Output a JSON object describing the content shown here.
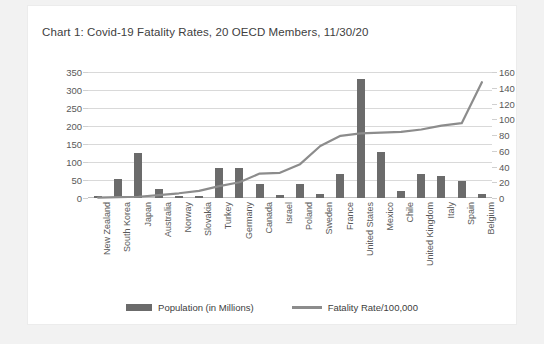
{
  "chart_data": {
    "type": "bar",
    "title": "Chart 1: Covid-19 Fatality Rates, 20 OECD Members, 11/30/20",
    "xlabel": "",
    "ylabel": "",
    "categories": [
      "New Zealand",
      "South Korea",
      "Japan",
      "Australia",
      "Norway",
      "Slovakia",
      "Turkey",
      "Germany",
      "Canada",
      "Israel",
      "Poland",
      "Sweden",
      "France",
      "United States",
      "Mexico",
      "Chile",
      "United Kingdom",
      "Italy",
      "Spain",
      "Belgium"
    ],
    "series": [
      {
        "name": "Population (in Millions)",
        "type": "bar",
        "axis": "left",
        "color": "#6b6b6b",
        "values": [
          5,
          52,
          126,
          25,
          5,
          5,
          84,
          83,
          38,
          9,
          38,
          10,
          67,
          330,
          128,
          19,
          67,
          60,
          47,
          11
        ]
      },
      {
        "name": "Fatality Rate/100,000",
        "type": "line",
        "axis": "right",
        "color": "#8c8c8c",
        "values": [
          0.5,
          1.0,
          1.6,
          3.7,
          6.0,
          9.0,
          15.0,
          20.0,
          31.0,
          32.0,
          43.0,
          66.0,
          79.0,
          82.0,
          83.0,
          84.0,
          87.0,
          92.0,
          95.0,
          147.0
        ]
      }
    ],
    "left_axis": {
      "ticks": [
        0,
        50,
        100,
        150,
        200,
        250,
        300,
        350
      ],
      "ylim": [
        0,
        350
      ]
    },
    "right_axis": {
      "ticks": [
        0,
        20,
        40,
        60,
        80,
        100,
        120,
        140,
        160
      ],
      "ylim": [
        0,
        160
      ]
    },
    "grid": true,
    "legend_position": "bottom",
    "legend": [
      "Population (in Millions)",
      "Fatality Rate/100,000"
    ]
  }
}
